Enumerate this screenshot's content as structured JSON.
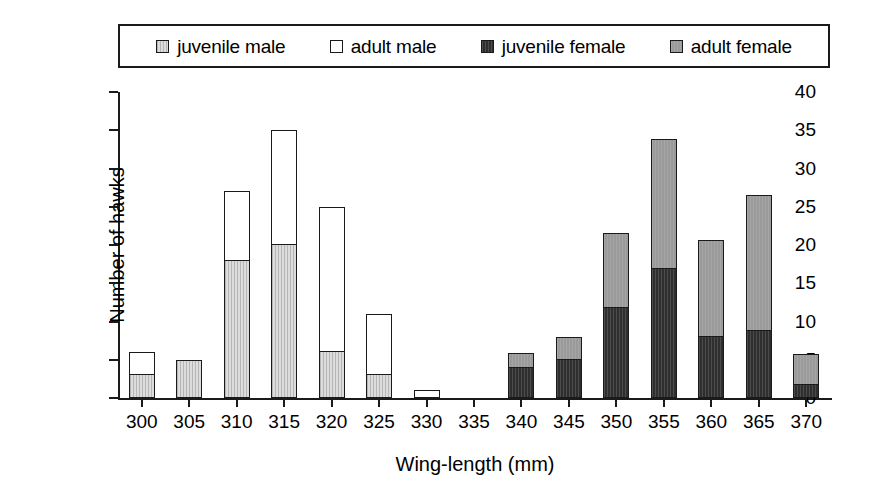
{
  "chart_data": {
    "type": "bar",
    "title": "",
    "subtitle": "",
    "xlabel": "Wing-length (mm)",
    "ylabel": "Number of hawks",
    "categories": [
      "300",
      "305",
      "310",
      "315",
      "320",
      "325",
      "330",
      "335",
      "340",
      "345",
      "350",
      "355",
      "360",
      "365",
      "370"
    ],
    "xlim": [
      300,
      370
    ],
    "ylim": [
      0,
      40
    ],
    "ytick_values": [
      0,
      5,
      10,
      15,
      20,
      25,
      30,
      35,
      40
    ],
    "ytick_labels": [
      "0",
      "5",
      "10",
      "15",
      "20",
      "25",
      "30",
      "35",
      "40"
    ],
    "grid": false,
    "stacked": true,
    "legend_position": "top",
    "series": [
      {
        "name": "juvenile male",
        "color": "#dcdcdc",
        "values": [
          3,
          5,
          18,
          20,
          6,
          3,
          0,
          0,
          0,
          0,
          0,
          0,
          0,
          0,
          0
        ]
      },
      {
        "name": "adult male",
        "color": "#ffffff",
        "values": [
          3,
          0,
          9,
          15,
          19,
          8,
          1,
          0,
          0,
          0,
          0,
          0,
          0,
          0,
          0
        ]
      },
      {
        "name": "juvenile female",
        "color": "#2f2f2f",
        "values": [
          0,
          0,
          0,
          0,
          0,
          0,
          0,
          0,
          4,
          5,
          11.8,
          16.8,
          7.9,
          8.7,
          1.7
        ]
      },
      {
        "name": "adult female",
        "color": "#9a9a9a",
        "values": [
          0,
          0,
          0,
          0,
          0,
          0,
          0,
          0,
          1.9,
          3,
          9.8,
          17,
          12.7,
          17.8,
          4
        ]
      }
    ],
    "stack_totals": [
      6,
      5,
      27,
      35,
      25,
      11,
      1,
      0,
      5.9,
      8,
      21.6,
      33.8,
      20.6,
      26.5,
      5.7
    ],
    "axis_color": "#1a1a1a",
    "background_color": "#ffffff"
  },
  "legend": {
    "items": [
      {
        "label": "juvenile male",
        "swatch_class": "fill-juv-male"
      },
      {
        "label": "adult male",
        "swatch_class": "fill-adult-male"
      },
      {
        "label": "juvenile female",
        "swatch_class": "fill-juv-female"
      },
      {
        "label": "adult female",
        "swatch_class": "fill-adult-female"
      }
    ]
  }
}
